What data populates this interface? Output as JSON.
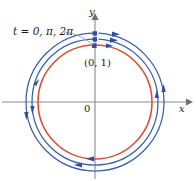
{
  "figure": {
    "background": "#ffffff",
    "width": 196,
    "height": 181,
    "axes": {
      "color": "#8a8a8a",
      "origin": {
        "x": 95,
        "y": 102
      },
      "x_axis": {
        "label": "x",
        "from_x": 2,
        "to_x": 190,
        "y": 102,
        "arrow": "right"
      },
      "y_axis": {
        "label": "y",
        "from_y": 178,
        "to_y": 14,
        "x": 95,
        "arrow": "up"
      },
      "origin_label": "0"
    },
    "labels": {
      "t_values_prefix": "t = 0, ",
      "t_values_pi": "π",
      "t_values_sep": ", 2",
      "t_values_pi2": "π",
      "t_values_full": "t = 0, π, 2π",
      "point_label": "(0, 1)",
      "x_axis_label": "x",
      "y_axis_label": "y",
      "origin_label": "0"
    },
    "colors": {
      "inner_circle": "#d9503a",
      "outer_curve": "#3b5fa8",
      "axis": "#8a8a8a",
      "leader_line": "#9a9a9a",
      "marker": "#2f4f9e",
      "text": "#1a1a1a"
    },
    "curves": [
      {
        "name": "inner-orange-circle",
        "color": "#d9503a",
        "cx": 95,
        "cy": 102,
        "r": 57,
        "stroke_width": 1.5
      },
      {
        "name": "middle-blue-arc",
        "color": "#3b5fa8",
        "cx": 95,
        "cy": 102,
        "r": 63,
        "stroke_width": 1.3
      },
      {
        "name": "outer-blue-arc",
        "color": "#3b5fa8",
        "cx": 95,
        "cy": 102,
        "r": 69,
        "stroke_width": 1.3
      }
    ],
    "direction": "counterclockwise",
    "markers": [
      {
        "name": "point-t-0",
        "x": 95,
        "y": 45
      },
      {
        "name": "point-t-pi",
        "x": 95,
        "y": 39
      },
      {
        "name": "point-t-2pi",
        "x": 95,
        "y": 33
      }
    ],
    "leader": {
      "from_x": 66,
      "from_y": 33,
      "to_x": 94,
      "to_y": 43
    }
  }
}
